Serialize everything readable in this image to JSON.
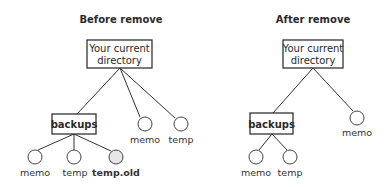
{
  "before": {
    "title": "Before remove",
    "root_line1": "Your current",
    "root_line2": "directory",
    "subdir": "backups",
    "subdir_children": [
      "memo",
      "temp",
      "temp.old"
    ],
    "root_files": [
      "memo",
      "temp"
    ]
  },
  "after": {
    "title": "After remove",
    "root_line1": "Your current",
    "root_line2": "directory",
    "subdir": "backups",
    "subdir_children": [
      "memo",
      "temp"
    ],
    "root_files": [
      "memo"
    ]
  },
  "colors": {
    "line": "#333333",
    "highlight_fill": "#e6e6e6"
  }
}
